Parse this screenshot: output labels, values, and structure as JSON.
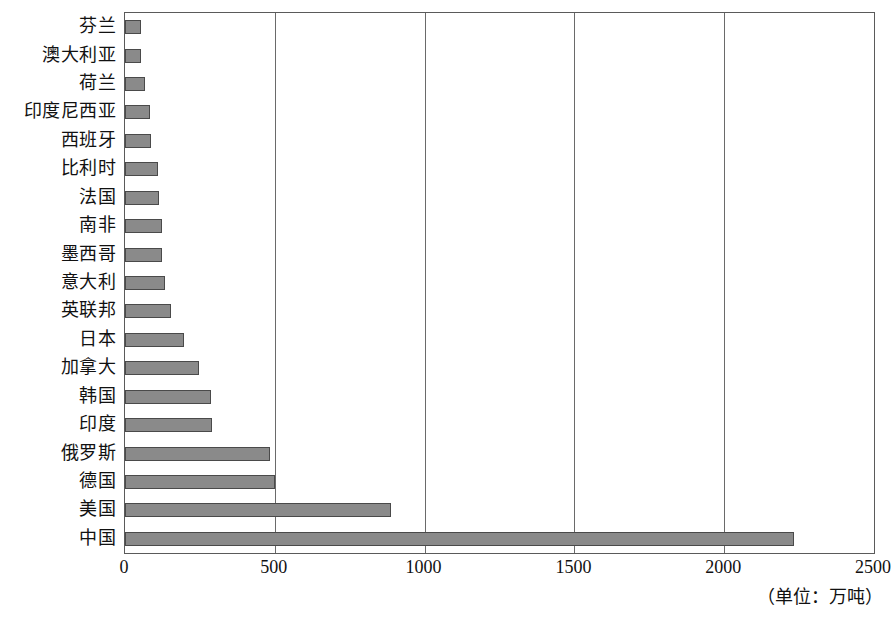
{
  "chart_data": {
    "type": "bar",
    "orientation": "horizontal",
    "title": "",
    "subtitle": "",
    "xlabel": "",
    "ylabel": "",
    "unit_note": "（单位：万吨）",
    "xlim": [
      0,
      2500
    ],
    "xticks": [
      0,
      500,
      1000,
      1500,
      2000,
      2500
    ],
    "xtick_labels": [
      "0",
      "500",
      "1000",
      "1500",
      "2000",
      "2500"
    ],
    "grid": true,
    "grid_axis": "x",
    "legend": null,
    "bar_color": "#8a8a8a",
    "bar_edge_color": "#4a4a4a",
    "axis_color": "#5a5a5a",
    "categories": [
      "芬兰",
      "澳大利亚",
      "荷兰",
      "印度尼西亚",
      "西班牙",
      "比利时",
      "法国",
      "南非",
      "墨西哥",
      "意大利",
      "英联邦",
      "日本",
      "加拿大",
      "韩国",
      "印度",
      "俄罗斯",
      "德国",
      "美国",
      "中国"
    ],
    "values": [
      52,
      55,
      68,
      82,
      88,
      110,
      112,
      122,
      124,
      135,
      152,
      197,
      248,
      288,
      292,
      485,
      500,
      888,
      2233
    ]
  }
}
